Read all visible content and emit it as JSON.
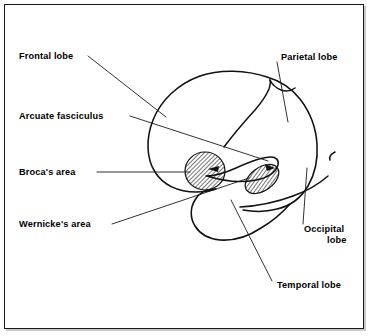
{
  "figure": {
    "kind": "anatomical-diagram",
    "background_color": "#ffffff",
    "line_color": "#111111",
    "text_color": "#000000",
    "frame": {
      "border_color": "#1a1a1a",
      "shadow_color": "#c9c9c9"
    }
  },
  "labels": {
    "frontal_lobe": "Frontal lobe",
    "arcuate_fasciculus": "Arcuate fasciculus",
    "brocas_area": "Broca's area",
    "wernickes_area": "Wernicke's area",
    "parietal_lobe": "Parietal lobe",
    "occipital_lobe_line1": "Occipital",
    "occipital_lobe_line2": "lobe",
    "temporal_lobe": "Temporal lobe"
  },
  "annotations": [
    {
      "id": "frontal-lobe",
      "text": "Frontal lobe",
      "side": "left",
      "text_x": 19,
      "text_y": 59,
      "leader_from": [
        88,
        56
      ],
      "leader_to": [
        166,
        117
      ]
    },
    {
      "id": "arcuate-fasciculus",
      "text": "Arcuate fasciculus",
      "side": "left",
      "text_x": 19,
      "text_y": 119,
      "leader_from": [
        130,
        116
      ],
      "leader_to": [
        268,
        161
      ]
    },
    {
      "id": "brocas-area",
      "text": "Broca's area",
      "side": "left",
      "text_x": 19,
      "text_y": 175,
      "leader_from": [
        97,
        172
      ],
      "leader_to": [
        188,
        172
      ]
    },
    {
      "id": "wernickes-area",
      "text": "Wernicke's area",
      "side": "left",
      "text_x": 19,
      "text_y": 227,
      "leader_from": [
        112,
        224
      ],
      "leader_to": [
        249,
        178
      ]
    },
    {
      "id": "parietal-lobe",
      "text": "Parietal lobe",
      "side": "right",
      "text_x": 279,
      "text_y": 57,
      "leader_from": [
        277,
        62
      ],
      "leader_to": [
        288,
        122
      ]
    },
    {
      "id": "occipital-lobe",
      "text": "Occipital lobe",
      "side": "right",
      "text_x": 304,
      "text_y": 230,
      "leader_from": [
        303,
        224
      ],
      "leader_to": [
        307,
        168
      ]
    },
    {
      "id": "temporal-lobe",
      "text": "Temporal lobe",
      "side": "right",
      "text_x": 276,
      "text_y": 285,
      "leader_from": [
        272,
        281
      ],
      "leader_to": [
        231,
        200
      ]
    }
  ],
  "shapes": {
    "brocas_area": {
      "type": "ellipse",
      "cx": 205,
      "cy": 171,
      "rx": 20,
      "ry": 19,
      "rotation": 0,
      "fill": "hatch-diagonal"
    },
    "wernickes_area": {
      "type": "ellipse",
      "cx": 262,
      "cy": 178,
      "rx": 19,
      "ry": 12,
      "rotation": -38,
      "fill": "hatch-diagonal"
    },
    "arcuate_fasciculus": {
      "type": "curved-band",
      "description": "Tapered band arching from Broca's area to Wernicke's area with arrowheads at both ends"
    }
  }
}
